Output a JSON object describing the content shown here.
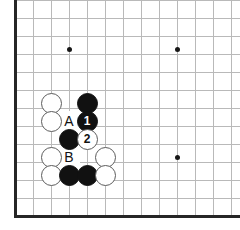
{
  "figure": {
    "type": "go-board-diagram",
    "board": {
      "left_edge_x": 15,
      "bottom_edge_y": 216,
      "grid_spacing": 18,
      "line_color": "#b9b9b9",
      "border_color": "#262626",
      "background": "#ffffff",
      "columns": 13,
      "rows": 12
    },
    "star_points": [
      {
        "name": "star-point-left",
        "x": 69,
        "y": 49
      },
      {
        "name": "star-point-right-top",
        "x": 177,
        "y": 49
      },
      {
        "name": "star-point-right-bottom",
        "x": 177,
        "y": 157
      }
    ],
    "stones": [
      {
        "color": "white",
        "x": 51,
        "y": 103,
        "label": ""
      },
      {
        "color": "black",
        "x": 87,
        "y": 103,
        "label": ""
      },
      {
        "color": "white",
        "x": 51,
        "y": 121,
        "label": ""
      },
      {
        "color": "black",
        "x": 87,
        "y": 121,
        "label": "1"
      },
      {
        "color": "black",
        "x": 69,
        "y": 139,
        "label": ""
      },
      {
        "color": "white",
        "x": 87,
        "y": 139,
        "label": "2"
      },
      {
        "color": "white",
        "x": 51,
        "y": 157,
        "label": ""
      },
      {
        "color": "white",
        "x": 105,
        "y": 157,
        "label": ""
      },
      {
        "color": "white",
        "x": 51,
        "y": 175,
        "label": ""
      },
      {
        "color": "black",
        "x": 69,
        "y": 175,
        "label": ""
      },
      {
        "color": "black",
        "x": 87,
        "y": 175,
        "label": ""
      },
      {
        "color": "white",
        "x": 105,
        "y": 175,
        "label": ""
      }
    ],
    "point_labels": [
      {
        "text": "A",
        "x": 69,
        "y": 121
      },
      {
        "text": "B",
        "x": 69,
        "y": 157
      }
    ],
    "move_numbers": [
      {
        "number": "1",
        "color": "black",
        "x": 87,
        "y": 121
      },
      {
        "number": "2",
        "color": "white",
        "x": 87,
        "y": 139
      }
    ]
  }
}
